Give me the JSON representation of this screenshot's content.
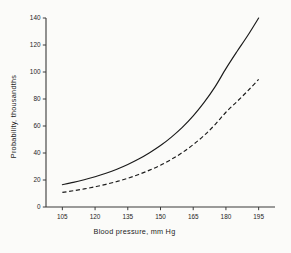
{
  "chart_data": {
    "type": "line",
    "title": "",
    "xlabel": "Blood pressure, mm Hg",
    "ylabel": "Probability, thousandths",
    "xlim": [
      97.5,
      202.5
    ],
    "ylim": [
      0,
      140
    ],
    "xticks": [
      105,
      120,
      135,
      150,
      165,
      180,
      195
    ],
    "yticks": [
      0,
      20,
      40,
      60,
      80,
      100,
      120,
      140
    ],
    "xticklabels": [
      "105",
      "120",
      "135",
      "150",
      "165",
      "180",
      "195"
    ],
    "yticklabels": [
      "0",
      "20",
      "40",
      "60",
      "80",
      "100",
      "120",
      "140"
    ],
    "grid": false,
    "legend": false,
    "x": [
      105,
      110,
      115,
      120,
      125,
      130,
      135,
      140,
      145,
      150,
      155,
      160,
      165,
      170,
      175,
      180,
      185,
      190,
      195
    ],
    "series": [
      {
        "name": "upper-curve",
        "style": "solid",
        "color": "#1a1a1a",
        "values": [
          16.5,
          18.2,
          20.2,
          22.4,
          25.0,
          28.0,
          31.5,
          35.5,
          40.2,
          45.5,
          51.8,
          59.0,
          67.5,
          77.5,
          89.0,
          102.5,
          115.0,
          127.0,
          140.0
        ]
      },
      {
        "name": "lower-curve",
        "style": "dashed",
        "color": "#1a1a1a",
        "values": [
          10.8,
          12.0,
          13.4,
          15.0,
          16.8,
          18.9,
          21.3,
          24.1,
          27.3,
          31.0,
          35.3,
          40.3,
          46.2,
          53.0,
          61.0,
          70.2,
          78.0,
          86.0,
          94.5
        ]
      }
    ]
  },
  "geometry": {
    "plot_left": 46,
    "plot_right": 275,
    "plot_top": 18,
    "plot_bottom": 207
  }
}
